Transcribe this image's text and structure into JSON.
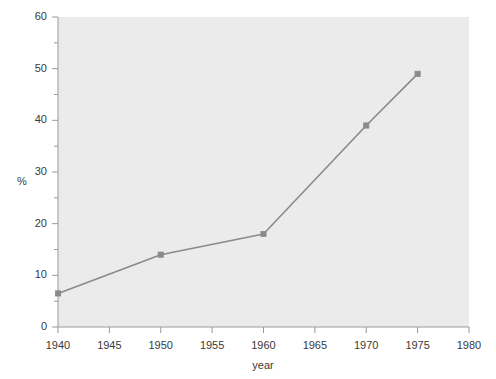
{
  "chart_data": {
    "type": "line",
    "title": "",
    "xlabel": "year",
    "ylabel": "%",
    "x": [
      1940,
      1950,
      1960,
      1970,
      1975
    ],
    "values": [
      6.5,
      14,
      18,
      39,
      49
    ],
    "series": [
      {
        "name": "percent",
        "x": [
          1940,
          1950,
          1960,
          1970,
          1975
        ],
        "values": [
          6.5,
          14,
          18,
          39,
          49
        ]
      }
    ],
    "xlim": [
      1940,
      1980
    ],
    "ylim": [
      0,
      60
    ],
    "x_major_ticks": [
      1940,
      1945,
      1950,
      1955,
      1960,
      1965,
      1970,
      1975,
      1980
    ],
    "x_tick_labels": [
      "1940",
      "1945",
      "1950",
      "1955",
      "1960",
      "1965",
      "1970",
      "1975",
      "1980"
    ],
    "y_major_ticks": [
      0,
      10,
      20,
      30,
      40,
      50,
      60
    ],
    "y_tick_labels": [
      "0",
      "10",
      "20",
      "30",
      "40",
      "50",
      "60"
    ],
    "y_minor_ticks": [
      5,
      15,
      25,
      35,
      45,
      55
    ],
    "grid": false,
    "legend": false,
    "marker": "square",
    "line_color": "#8a8a8a",
    "marker_color": "#8a8a8a",
    "plot_background": "#ebebeb",
    "figure_background": "#ffffff",
    "axis_color": "#9a9a9a",
    "text_color": "#3a3a3a"
  },
  "axes": {
    "x_title": "year",
    "y_title": "%"
  }
}
